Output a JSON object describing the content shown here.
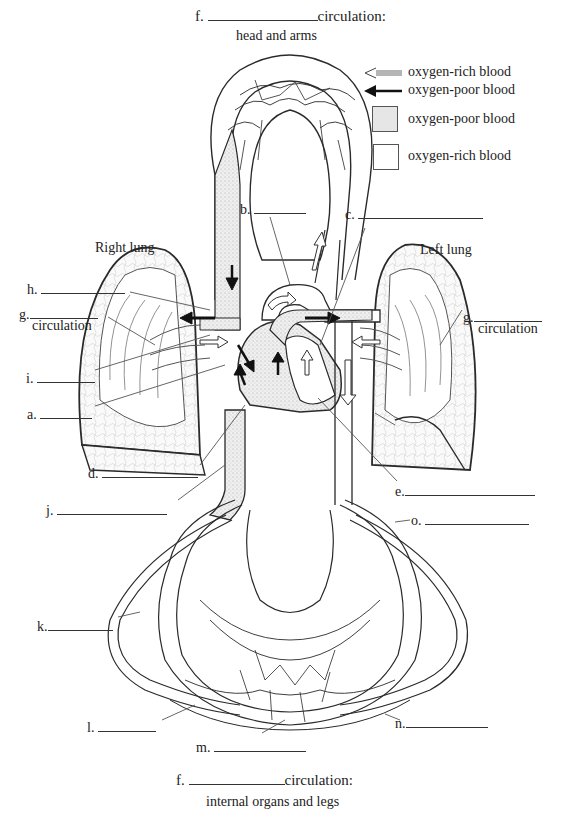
{
  "colors": {
    "line": "#2a2a2a",
    "oxygen_poor_fill": "#e6e6e6",
    "oxygen_rich_fill": "#ffffff"
  },
  "top_title": {
    "prefix": "f.",
    "suffix": "circulation:",
    "subtitle": "head and arms"
  },
  "bottom_title": {
    "prefix": "f.",
    "suffix": "circulation:",
    "subtitle": "internal organs and legs"
  },
  "legend": [
    {
      "icon": "hollow-arrow-icon",
      "label": "oxygen-rich blood"
    },
    {
      "icon": "solid-arrow-icon",
      "label": "oxygen-poor blood"
    },
    {
      "icon": "stippled-box-icon",
      "label": "oxygen-poor blood"
    },
    {
      "icon": "empty-box-icon",
      "label": "oxygen-rich blood"
    }
  ],
  "organs": {
    "right_lung": "Right lung",
    "left_lung": "Left lung"
  },
  "labels": {
    "a": "a.",
    "b": "b.",
    "c": "c.",
    "d": "d.",
    "e": "e.",
    "g_left": "g.",
    "g_left_sub": "circulation",
    "g_right": "g.",
    "g_right_sub": "circulation",
    "h": "h.",
    "i": "i.",
    "j": "j.",
    "k": "k.",
    "l": "l.",
    "m": "m.",
    "n": "n.",
    "o": "o."
  }
}
